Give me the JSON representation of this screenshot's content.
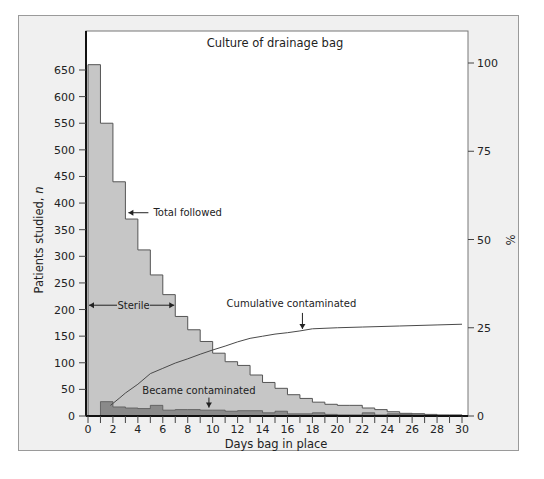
{
  "chart_data": {
    "type": "bar",
    "title": "Culture of drainage bag",
    "xlabel": "Days bag in place",
    "ylabel": "Patients studied, n",
    "ylabel_right": "%",
    "xlim": [
      0,
      30
    ],
    "ylim": [
      0,
      660
    ],
    "ylim_right": [
      0,
      100
    ],
    "x_ticks": [
      0,
      2,
      4,
      6,
      8,
      10,
      12,
      14,
      16,
      18,
      20,
      22,
      24,
      26,
      28,
      30
    ],
    "y_ticks": [
      0,
      50,
      100,
      150,
      200,
      250,
      300,
      350,
      400,
      450,
      500,
      550,
      600,
      650
    ],
    "y_ticks_right": [
      0,
      25,
      50,
      75,
      100
    ],
    "grid": false,
    "legend": "none (inline annotations)",
    "series": [
      {
        "name": "Total followed",
        "type": "step-bar",
        "bin_start": [
          0,
          1,
          2,
          3,
          4,
          5,
          6,
          7,
          8,
          9,
          10,
          11,
          12,
          13,
          14,
          15,
          16,
          17,
          18,
          19,
          20,
          21,
          22,
          23,
          24,
          25,
          26,
          27,
          28,
          29
        ],
        "values": [
          660,
          550,
          440,
          370,
          312,
          265,
          228,
          187,
          162,
          140,
          118,
          102,
          95,
          77,
          63,
          52,
          40,
          33,
          26,
          22,
          20,
          20,
          15,
          12,
          8,
          5,
          4,
          3,
          2,
          2
        ]
      },
      {
        "name": "Became contaminated",
        "type": "step-bar",
        "bin_start": [
          1,
          2,
          3,
          4,
          5,
          6,
          7,
          8,
          9,
          10,
          11,
          12,
          13,
          14,
          15,
          16,
          17,
          18,
          19,
          20,
          21,
          22,
          23,
          24,
          25,
          26,
          27,
          28,
          29
        ],
        "values": [
          27,
          17,
          15,
          14,
          20,
          11,
          12,
          12,
          11,
          11,
          9,
          10,
          10,
          6,
          9,
          4,
          4,
          6,
          3,
          2,
          2,
          6,
          2,
          4,
          3,
          4,
          1,
          1,
          1
        ]
      },
      {
        "name": "Cumulative contaminated",
        "type": "line",
        "axis": "right",
        "x": [
          1.8,
          2.5,
          3,
          4,
          5,
          6,
          7,
          8,
          9,
          10,
          11,
          12,
          13,
          14,
          15,
          16,
          17,
          18,
          20,
          22,
          25,
          28,
          30
        ],
        "values": [
          3,
          5,
          6.5,
          9,
          12,
          13.5,
          15,
          16.2,
          17.5,
          18.7,
          19.8,
          21,
          22,
          22.6,
          23.2,
          23.6,
          24.1,
          24.7,
          25.0,
          25.2,
          25.5,
          25.8,
          26
        ]
      }
    ],
    "annotations": [
      {
        "text": "Total followed",
        "arrow": "left",
        "x": 3,
        "y": 380
      },
      {
        "text": "Sterile",
        "arrow": "both",
        "x_from": 0,
        "x_to": 7,
        "y": 210
      },
      {
        "text": "Cumulative contaminated",
        "arrow": "down",
        "x": 17.2,
        "y_pct": 24.1
      },
      {
        "text": "Became contaminated",
        "arrow": "down",
        "x": 9.7,
        "y": 12
      }
    ]
  },
  "colors": {
    "panel_bg": "#f0f0f0",
    "plot_bg": "#ffffff",
    "total_fill": "#c6c6c6",
    "contaminated_fill": "#8a8a8a",
    "line": "#4a4a4a",
    "axis": "#111111"
  }
}
